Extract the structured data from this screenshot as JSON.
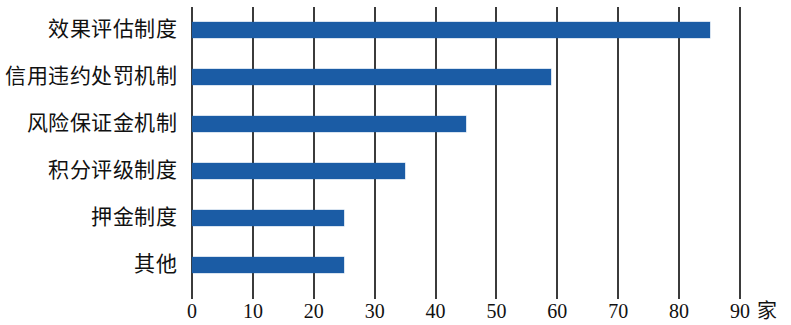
{
  "chart_data": {
    "type": "bar",
    "orientation": "horizontal",
    "title": "",
    "subtitle": "",
    "xlabel": "家",
    "ylabel": "",
    "categories": [
      "效果评估制度",
      "信用违约处罚机制",
      "风险保证金机制",
      "积分评级制度",
      "押金制度",
      "其他"
    ],
    "values": [
      85,
      59,
      45,
      35,
      25,
      25
    ],
    "xlim": [
      0,
      90
    ],
    "xticks": [
      0,
      10,
      20,
      30,
      40,
      50,
      60,
      70,
      80,
      90
    ],
    "xtick_labels": [
      "0",
      "10",
      "20",
      "30",
      "40",
      "50",
      "60",
      "70",
      "80",
      "90"
    ],
    "unit": "家",
    "grid": true,
    "grid_axis": "x",
    "legend": false,
    "bar_color": "#1b5ca5",
    "axis_color": "#3b3b3b",
    "background": "#ffffff"
  }
}
